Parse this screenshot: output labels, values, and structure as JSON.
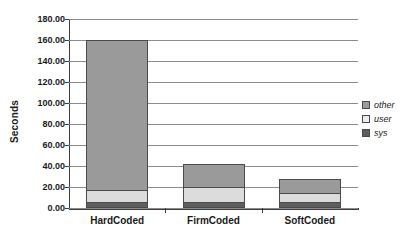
{
  "chart_data": {
    "type": "bar",
    "stacked": true,
    "title": "",
    "xlabel": "",
    "ylabel": "Seconds",
    "categories": [
      "HardCoded",
      "FirmCoded",
      "SoftCoded"
    ],
    "series": [
      {
        "name": "sys",
        "values": [
          4,
          4,
          4
        ],
        "color": "#5e5e5e"
      },
      {
        "name": "user",
        "values": [
          12,
          16,
          10
        ],
        "color": "#dcdcdc"
      },
      {
        "name": "other",
        "values": [
          144,
          22,
          14
        ],
        "color": "#9a9a9a"
      }
    ],
    "totals": [
      160,
      42,
      28
    ],
    "ylim": [
      0,
      180
    ],
    "ytick_step": 20,
    "ytick_labels": [
      "0.00",
      "20.00",
      "40.00",
      "60.00",
      "80.00",
      "100.00",
      "120.00",
      "140.00",
      "160.00",
      "180.00"
    ],
    "grid": true,
    "legend_position": "right",
    "legend": [
      "other",
      "user",
      "sys"
    ]
  },
  "axis": {
    "y_title": "Seconds"
  },
  "legend": {
    "items": [
      {
        "label": "other",
        "swatch": "legend-swatch-other"
      },
      {
        "label": "user",
        "swatch": "legend-swatch-user"
      },
      {
        "label": "sys",
        "swatch": "legend-swatch-sys"
      }
    ]
  }
}
